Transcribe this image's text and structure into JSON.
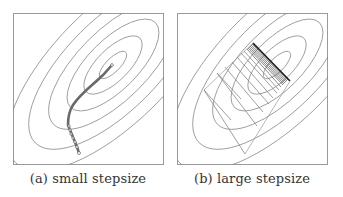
{
  "figure": {
    "panels": [
      {
        "id": "a",
        "caption": "(a) small stepsize",
        "description": "Elliptical contour lines of a quadratic objective with a gradient descent trajectory of many small steps curving from the bottom toward the minimum."
      },
      {
        "id": "b",
        "caption": "(b) large stepsize",
        "description": "Same elliptical contours with a gradient descent trajectory of large steps zig-zagging across the valley, converging into a dense band of oscillations near the upper-right."
      }
    ]
  },
  "colors": {
    "frame": "#9a9a9a",
    "contour": "#8c8c8c",
    "path": "#6a6a6a",
    "path_dense": "#333333",
    "caption": "#333333"
  }
}
